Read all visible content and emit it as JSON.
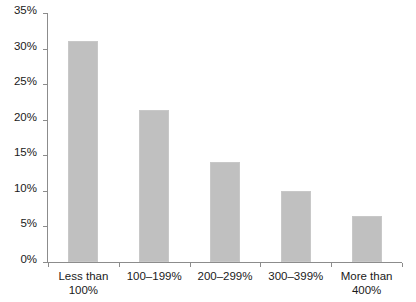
{
  "chart_data": {
    "type": "bar",
    "title": "",
    "subtitle": "",
    "xlabel": "",
    "ylabel": "",
    "categories": [
      "Less than 100%",
      "100–199%",
      "200–299%",
      "300–399%",
      "More than 400%"
    ],
    "category_lines": [
      [
        "Less than",
        "100%"
      ],
      [
        "100–199%",
        ""
      ],
      [
        "200–299%",
        ""
      ],
      [
        "300–399%",
        ""
      ],
      [
        "More than",
        "400%"
      ]
    ],
    "values": [
      31,
      21.3,
      14,
      10,
      6.5
    ],
    "value_labels": [
      "31%",
      "21.3%",
      "14%",
      "10%",
      "6.5%"
    ],
    "ylim": [
      0,
      35
    ],
    "ytick_values": [
      0,
      5,
      10,
      15,
      20,
      25,
      30,
      35
    ],
    "ytick_labels": [
      "0%",
      "5%",
      "10%",
      "15%",
      "20%",
      "25%",
      "30%",
      "35%"
    ],
    "grid": false,
    "legend": false,
    "legend_position": "none",
    "bar_color": "#c0c0c0",
    "axis_color": "#8c8c8c",
    "text_color": "#1a1a1a",
    "background_color": "#ffffff"
  }
}
